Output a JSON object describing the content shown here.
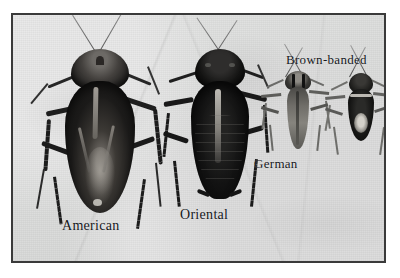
{
  "figure": {
    "kind": "photographic-plate",
    "background_color": "#dcdddc",
    "frame_color": "#3a3a3a",
    "page_color": "#ffffff",
    "ink_color": "#14161a"
  },
  "specimens": [
    {
      "id": "american",
      "label": "American",
      "label_x": 60,
      "label_y": 218,
      "label_size": 14,
      "body_color": "#20201f",
      "relative_size": "largest"
    },
    {
      "id": "oriental",
      "label": "Oriental",
      "label_x": 178,
      "label_y": 207,
      "label_size": 14,
      "body_color": "#0d0d0e",
      "relative_size": "large"
    },
    {
      "id": "german",
      "label": "German",
      "label_x": 252,
      "label_y": 156,
      "label_size": 13,
      "body_color": "#3a3a38",
      "relative_size": "small"
    },
    {
      "id": "brown-banded",
      "label": "Brown-banded",
      "label_x": 284,
      "label_y": 52,
      "label_size": 13,
      "body_color": "#1a1a1a",
      "relative_size": "smallest"
    }
  ]
}
